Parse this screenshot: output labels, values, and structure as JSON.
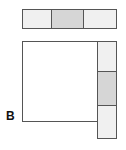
{
  "diagram": {
    "label": "B",
    "colors": {
      "light": "#f0f0f0",
      "dark": "#d6d6d6",
      "border": "#555555",
      "square": "#ffffff"
    },
    "top_bar": {
      "cells": [
        {
          "shade": "light"
        },
        {
          "shade": "dark"
        },
        {
          "shade": "light"
        }
      ]
    },
    "side_bar": {
      "cells": [
        {
          "shade": "light"
        },
        {
          "shade": "dark"
        },
        {
          "shade": "light"
        }
      ]
    }
  }
}
